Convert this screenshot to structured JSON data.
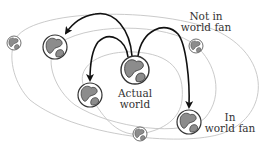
{
  "diagram": {
    "labels": {
      "actual_world_line1": "Actual",
      "actual_world_line2": "world",
      "not_in_fan_line1": "Not in",
      "not_in_fan_line2": "world fan",
      "in_fan_line1": "In",
      "in_fan_line2": "world fan"
    },
    "nodes": [
      {
        "id": "actual-world",
        "role": "center",
        "label": "Actual world"
      },
      {
        "id": "upper-left-world",
        "role": "in-fan"
      },
      {
        "id": "mid-left-world",
        "role": "in-fan"
      },
      {
        "id": "in-fan-world",
        "role": "in-fan",
        "label": "In world fan"
      },
      {
        "id": "far-left-world",
        "role": "not-in-fan"
      },
      {
        "id": "not-in-fan-world",
        "role": "not-in-fan",
        "label": "Not in world fan"
      },
      {
        "id": "bottom-world",
        "role": "not-in-fan"
      }
    ],
    "edges": [
      {
        "from": "actual-world",
        "to": "upper-left-world"
      },
      {
        "from": "actual-world",
        "to": "mid-left-world"
      },
      {
        "from": "actual-world",
        "to": "in-fan-world"
      }
    ],
    "colors": {
      "orbit": "#c4c4c4",
      "arrow": "#111111",
      "land": "#8c8c8c",
      "outline": "#333333"
    }
  }
}
